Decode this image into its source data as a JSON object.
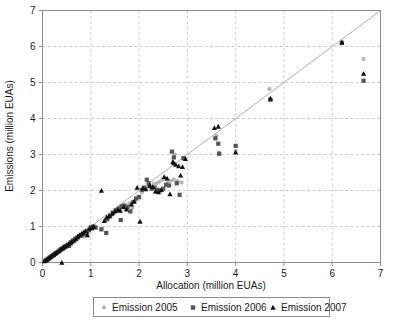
{
  "chart_data": {
    "type": "scatter",
    "title": "",
    "xlabel": "Allocation (million EUAs)",
    "ylabel": "Emissions (million EUAs)",
    "xlim": [
      0,
      7
    ],
    "ylim": [
      0,
      7
    ],
    "xticks": [
      "0",
      "1",
      "2",
      "3",
      "4",
      "5",
      "6",
      "7"
    ],
    "yticks": [
      "0",
      "1",
      "2",
      "3",
      "4",
      "5",
      "6",
      "7"
    ],
    "grid": true,
    "legend_position": "bottom",
    "annotations": [
      "identity line y = x"
    ],
    "series": [
      {
        "name": "Emission 2005",
        "marker": "circle",
        "color": "#b5b5b5",
        "points": [
          [
            0.05,
            0.05
          ],
          [
            0.08,
            0.07
          ],
          [
            0.11,
            0.1
          ],
          [
            0.14,
            0.13
          ],
          [
            0.17,
            0.16
          ],
          [
            0.2,
            0.19
          ],
          [
            0.24,
            0.22
          ],
          [
            0.27,
            0.26
          ],
          [
            0.3,
            0.29
          ],
          [
            0.33,
            0.31
          ],
          [
            0.36,
            0.35
          ],
          [
            0.4,
            0.38
          ],
          [
            0.43,
            0.41
          ],
          [
            0.46,
            0.45
          ],
          [
            0.5,
            0.47
          ],
          [
            0.53,
            0.5
          ],
          [
            0.57,
            0.55
          ],
          [
            0.62,
            0.6
          ],
          [
            0.66,
            0.64
          ],
          [
            0.7,
            0.67
          ],
          [
            0.74,
            0.72
          ],
          [
            0.78,
            0.74
          ],
          [
            0.82,
            0.78
          ],
          [
            0.86,
            0.72
          ],
          [
            0.9,
            0.81
          ],
          [
            0.94,
            0.86
          ],
          [
            0.98,
            0.92
          ],
          [
            1.0,
            0.95
          ],
          [
            1.04,
            0.97
          ],
          [
            1.08,
            0.99
          ],
          [
            1.22,
            0.94
          ],
          [
            1.3,
            1.18
          ],
          [
            1.36,
            1.22
          ],
          [
            1.42,
            1.32
          ],
          [
            1.48,
            1.4
          ],
          [
            1.54,
            1.48
          ],
          [
            1.6,
            1.52
          ],
          [
            1.66,
            1.6
          ],
          [
            1.72,
            1.55
          ],
          [
            1.8,
            1.64
          ],
          [
            1.86,
            1.52
          ],
          [
            1.92,
            1.72
          ],
          [
            2.0,
            1.8
          ],
          [
            2.06,
            1.95
          ],
          [
            2.12,
            2.05
          ],
          [
            2.18,
            2.1
          ],
          [
            2.24,
            2.12
          ],
          [
            2.3,
            2.18
          ],
          [
            2.36,
            2.2
          ],
          [
            2.42,
            2.24
          ],
          [
            2.48,
            2.3
          ],
          [
            2.54,
            2.33
          ],
          [
            2.6,
            2.25
          ],
          [
            2.66,
            2.27
          ],
          [
            2.72,
            2.3
          ],
          [
            2.74,
            3.0
          ],
          [
            2.8,
            2.26
          ],
          [
            2.88,
            2.22
          ],
          [
            2.94,
            2.88
          ],
          [
            3.6,
            3.52
          ],
          [
            3.65,
            3.05
          ],
          [
            4.0,
            3.1
          ],
          [
            4.7,
            4.82
          ],
          [
            6.2,
            6.08
          ],
          [
            6.65,
            5.65
          ]
        ]
      },
      {
        "name": "Emission 2006",
        "marker": "square",
        "color": "#555555",
        "points": [
          [
            0.06,
            0.05
          ],
          [
            0.09,
            0.08
          ],
          [
            0.12,
            0.11
          ],
          [
            0.15,
            0.14
          ],
          [
            0.18,
            0.17
          ],
          [
            0.22,
            0.21
          ],
          [
            0.25,
            0.24
          ],
          [
            0.28,
            0.27
          ],
          [
            0.32,
            0.3
          ],
          [
            0.35,
            0.33
          ],
          [
            0.38,
            0.37
          ],
          [
            0.42,
            0.4
          ],
          [
            0.45,
            0.43
          ],
          [
            0.48,
            0.46
          ],
          [
            0.52,
            0.49
          ],
          [
            0.55,
            0.46
          ],
          [
            0.59,
            0.56
          ],
          [
            0.63,
            0.61
          ],
          [
            0.68,
            0.66
          ],
          [
            0.72,
            0.7
          ],
          [
            0.76,
            0.74
          ],
          [
            0.8,
            0.75
          ],
          [
            0.84,
            0.79
          ],
          [
            0.88,
            0.82
          ],
          [
            0.92,
            0.85
          ],
          [
            0.96,
            0.9
          ],
          [
            1.0,
            0.98
          ],
          [
            1.05,
            1.0
          ],
          [
            1.1,
            0.97
          ],
          [
            1.22,
            0.92
          ],
          [
            1.32,
            0.82
          ],
          [
            1.34,
            1.2
          ],
          [
            1.4,
            1.28
          ],
          [
            1.46,
            1.38
          ],
          [
            1.52,
            1.45
          ],
          [
            1.58,
            1.5
          ],
          [
            1.62,
            1.18
          ],
          [
            1.64,
            1.56
          ],
          [
            1.7,
            1.58
          ],
          [
            1.76,
            1.54
          ],
          [
            1.82,
            1.42
          ],
          [
            1.88,
            1.68
          ],
          [
            1.94,
            1.78
          ],
          [
            2.0,
            1.82
          ],
          [
            2.06,
            2.02
          ],
          [
            2.1,
            2.08
          ],
          [
            2.16,
            2.3
          ],
          [
            2.2,
            2.2
          ],
          [
            2.26,
            2.05
          ],
          [
            2.32,
            2.08
          ],
          [
            2.38,
            2.02
          ],
          [
            2.44,
            2.0
          ],
          [
            2.5,
            2.05
          ],
          [
            2.56,
            2.16
          ],
          [
            2.62,
            2.14
          ],
          [
            2.68,
            3.08
          ],
          [
            2.72,
            2.92
          ],
          [
            2.78,
            2.2
          ],
          [
            2.84,
            1.88
          ],
          [
            2.92,
            2.9
          ],
          [
            3.58,
            3.45
          ],
          [
            3.64,
            3.3
          ],
          [
            3.66,
            3.02
          ],
          [
            4.0,
            3.24
          ],
          [
            4.72,
            4.52
          ],
          [
            6.2,
            6.1
          ],
          [
            6.65,
            5.05
          ]
        ]
      },
      {
        "name": "Emission 2007",
        "marker": "triangle",
        "color": "#111111",
        "points": [
          [
            0.04,
            0.04
          ],
          [
            0.07,
            0.06
          ],
          [
            0.1,
            0.09
          ],
          [
            0.13,
            0.12
          ],
          [
            0.16,
            0.15
          ],
          [
            0.19,
            0.18
          ],
          [
            0.23,
            0.21
          ],
          [
            0.26,
            0.25
          ],
          [
            0.29,
            0.28
          ],
          [
            0.34,
            0.32
          ],
          [
            0.37,
            0.36
          ],
          [
            0.4,
            0.0
          ],
          [
            0.41,
            0.39
          ],
          [
            0.44,
            0.42
          ],
          [
            0.47,
            0.44
          ],
          [
            0.51,
            0.48
          ],
          [
            0.54,
            0.52
          ],
          [
            0.58,
            0.54
          ],
          [
            0.61,
            0.58
          ],
          [
            0.65,
            0.62
          ],
          [
            0.69,
            0.65
          ],
          [
            0.73,
            0.71
          ],
          [
            0.77,
            0.76
          ],
          [
            0.81,
            0.8
          ],
          [
            0.85,
            0.84
          ],
          [
            0.89,
            0.88
          ],
          [
            0.93,
            0.76
          ],
          [
            0.97,
            0.94
          ],
          [
            1.02,
            0.96
          ],
          [
            1.06,
            1.0
          ],
          [
            1.22,
            2.0
          ],
          [
            1.28,
            1.16
          ],
          [
            1.33,
            1.26
          ],
          [
            1.38,
            1.3
          ],
          [
            1.44,
            1.36
          ],
          [
            1.5,
            1.42
          ],
          [
            1.56,
            1.46
          ],
          [
            1.61,
            1.44
          ],
          [
            1.68,
            1.54
          ],
          [
            1.74,
            1.48
          ],
          [
            1.84,
            1.62
          ],
          [
            1.9,
            1.7
          ],
          [
            1.96,
            2.08
          ],
          [
            2.02,
            1.14
          ],
          [
            2.08,
            2.06
          ],
          [
            2.14,
            2.04
          ],
          [
            2.22,
            2.14
          ],
          [
            2.28,
            2.1
          ],
          [
            2.34,
            1.98
          ],
          [
            2.4,
            1.96
          ],
          [
            2.46,
            2.02
          ],
          [
            2.52,
            2.38
          ],
          [
            2.58,
            2.34
          ],
          [
            2.64,
            1.9
          ],
          [
            2.7,
            2.8
          ],
          [
            2.72,
            2.76
          ],
          [
            2.76,
            2.72
          ],
          [
            2.82,
            2.68
          ],
          [
            2.86,
            2.42
          ],
          [
            2.9,
            2.66
          ],
          [
            2.96,
            2.88
          ],
          [
            3.56,
            3.74
          ],
          [
            3.64,
            3.78
          ],
          [
            4.0,
            3.06
          ],
          [
            4.72,
            4.56
          ],
          [
            6.2,
            6.12
          ],
          [
            6.65,
            5.25
          ]
        ]
      }
    ]
  },
  "legend": {
    "items": [
      {
        "label": "Emission 2005",
        "marker": "circle-marker",
        "color": "#b5b5b5"
      },
      {
        "label": "Emission 2006",
        "marker": "square-marker",
        "color": "#555555"
      },
      {
        "label": "Emission 2007",
        "marker": "triangle-marker",
        "color": "#111111"
      }
    ]
  },
  "colors": {
    "series_2005": "#b5b5b5",
    "series_2006": "#555555",
    "series_2007": "#111111",
    "grid": "#b9b9b9",
    "axis": "#8d8d8d",
    "identity_line": "#9a9a9a",
    "background": "#ffffff"
  }
}
